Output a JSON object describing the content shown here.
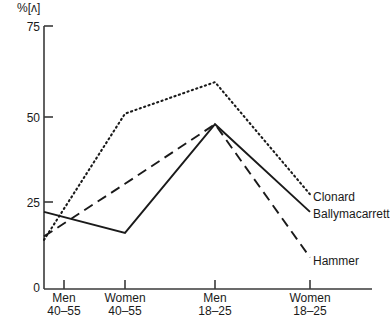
{
  "chart_data": {
    "type": "line",
    "title": "",
    "ylabel": "%[ʌ]",
    "xlabel": "",
    "ylim": [
      0,
      75
    ],
    "yticks": [
      0,
      25,
      50,
      75
    ],
    "ytick_labels": [
      "0",
      "25",
      "50",
      "75"
    ],
    "grid": false,
    "legend_position": "right-inline",
    "categories": [
      "Men 40-55",
      "Women 40-55",
      "Men 18-25",
      "Women 18-25"
    ],
    "category_lines": [
      {
        "line1": "Men",
        "line2": "40–55"
      },
      {
        "line1": "Women",
        "line2": "40–55"
      },
      {
        "line1": "Men",
        "line2": "18–25"
      },
      {
        "line1": "Women",
        "line2": "18–25"
      }
    ],
    "series": [
      {
        "name": "Clonard",
        "style": "dotted",
        "color": "#1a1a1a",
        "values": [
          14,
          50,
          59,
          27
        ]
      },
      {
        "name": "Ballymacarrett",
        "style": "solid",
        "color": "#1a1a1a",
        "values": [
          22,
          16,
          47,
          22
        ]
      },
      {
        "name": "Hammer",
        "style": "dashed",
        "color": "#1a1a1a",
        "values": [
          15,
          30,
          47,
          9
        ]
      }
    ]
  },
  "axis": {
    "y_title": "%[ʌ]",
    "ticks": [
      {
        "label": "75"
      },
      {
        "label": "50"
      },
      {
        "label": "25"
      },
      {
        "label": "0"
      }
    ]
  },
  "legend": {
    "items": [
      {
        "label": "Clonard"
      },
      {
        "label": "Ballymacarrett"
      },
      {
        "label": "Hammer"
      }
    ]
  }
}
